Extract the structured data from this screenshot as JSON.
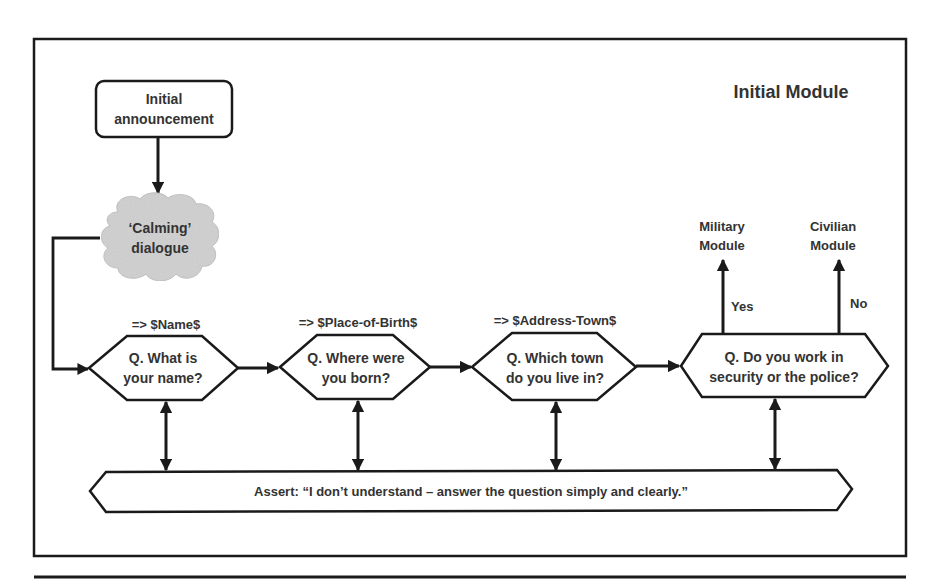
{
  "diagram": {
    "title": "Initial Module",
    "colors": {
      "line": "#1a1a1a",
      "text": "#333333",
      "cloud_fill": "#c9c9c9",
      "background": "#ffffff"
    },
    "start_box": {
      "line1": "Initial",
      "line2": "announcement"
    },
    "cloud": {
      "line1": "‘Calming’",
      "line2": "dialogue"
    },
    "questions": [
      {
        "variable": "=> $Name$",
        "line1": "Q. What is",
        "line2": "your name?"
      },
      {
        "variable": "=> $Place-of-Birth$",
        "line1": "Q. Where were",
        "line2": "you born?"
      },
      {
        "variable": "=> $Address-Town$",
        "line1": "Q. Which town",
        "line2": "do you live in?"
      },
      {
        "variable": "",
        "line1": "Q. Do you work in",
        "line2": "security or the police?"
      }
    ],
    "branches": {
      "yes": {
        "label": "Yes",
        "target_line1": "Military",
        "target_line2": "Module"
      },
      "no": {
        "label": "No",
        "target_line1": "Civilian",
        "target_line2": "Module"
      }
    },
    "assert": {
      "text": "Assert: “I don’t understand – answer the question simply and clearly.”"
    }
  }
}
